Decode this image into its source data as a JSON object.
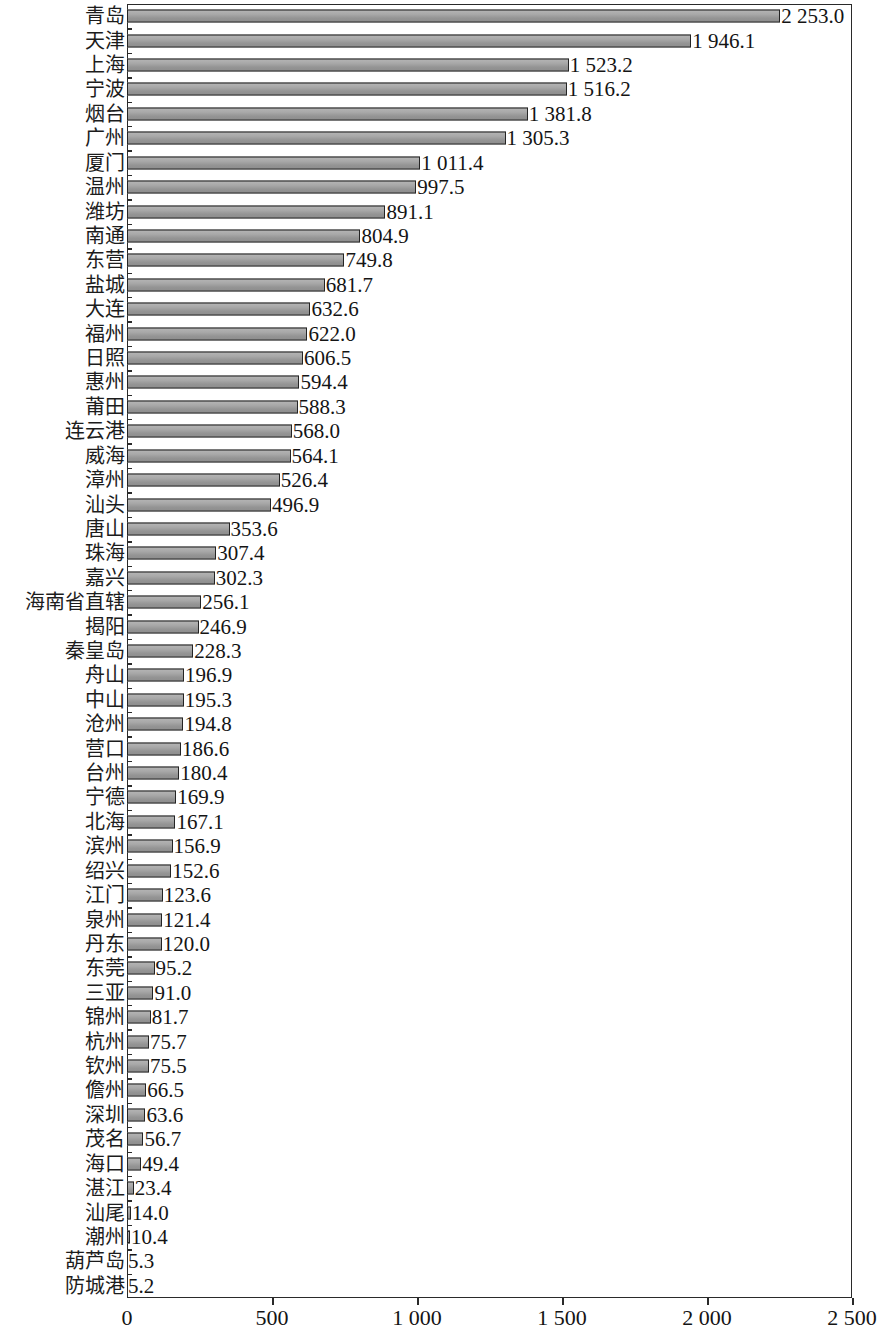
{
  "chart_data": {
    "type": "bar",
    "orientation": "horizontal",
    "title": "",
    "subtitle": "",
    "xlabel": "",
    "ylabel": "",
    "xlim": [
      0,
      2500
    ],
    "xticks": [
      0,
      500,
      1000,
      1500,
      2000,
      2500
    ],
    "xtick_labels": [
      "0",
      "500",
      "1 000",
      "1 500",
      "2 000",
      "2 500"
    ],
    "grid": false,
    "legend": null,
    "bar_color": "#9e9e9e",
    "bar_edge_color": "#242424",
    "axis_color": "#2a2a2a",
    "categories": [
      "青岛",
      "天津",
      "上海",
      "宁波",
      "烟台",
      "广州",
      "厦门",
      "温州",
      "潍坊",
      "南通",
      "东营",
      "盐城",
      "大连",
      "福州",
      "日照",
      "惠州",
      "莆田",
      "连云港",
      "威海",
      "漳州",
      "汕头",
      "唐山",
      "珠海",
      "嘉兴",
      "海南省直辖",
      "揭阳",
      "秦皇岛",
      "舟山",
      "中山",
      "沧州",
      "营口",
      "台州",
      "宁德",
      "北海",
      "滨州",
      "绍兴",
      "江门",
      "泉州",
      "丹东",
      "东莞",
      "三亚",
      "锦州",
      "杭州",
      "钦州",
      "儋州",
      "深圳",
      "茂名",
      "海口",
      "湛江",
      "汕尾",
      "潮州",
      "葫芦岛",
      "防城港"
    ],
    "values": [
      2253.0,
      1946.1,
      1523.2,
      1516.2,
      1381.8,
      1305.3,
      1011.4,
      997.5,
      891.1,
      804.9,
      749.8,
      681.7,
      632.6,
      622.0,
      606.5,
      594.4,
      588.3,
      568.0,
      564.1,
      526.4,
      496.9,
      353.6,
      307.4,
      302.3,
      256.1,
      246.9,
      228.3,
      196.9,
      195.3,
      194.8,
      186.6,
      180.4,
      169.9,
      167.1,
      156.9,
      152.6,
      123.6,
      121.4,
      120.0,
      95.2,
      91.0,
      81.7,
      75.7,
      75.5,
      66.5,
      63.6,
      56.7,
      49.4,
      23.4,
      14.0,
      10.4,
      5.3,
      5.2
    ],
    "value_labels": [
      "2 253.0",
      "1 946.1",
      "1 523.2",
      "1 516.2",
      "1 381.8",
      "1 305.3",
      "1 011.4",
      "997.5",
      "891.1",
      "804.9",
      "749.8",
      "681.7",
      "632.6",
      "622.0",
      "606.5",
      "594.4",
      "588.3",
      "568.0",
      "564.1",
      "526.4",
      "496.9",
      "353.6",
      "307.4",
      "302.3",
      "256.1",
      "246.9",
      "228.3",
      "196.9",
      "195.3",
      "194.8",
      "186.6",
      "180.4",
      "169.9",
      "167.1",
      "156.9",
      "152.6",
      "123.6",
      "121.4",
      "120.0",
      "95.2",
      "91.0",
      "81.7",
      "75.7",
      "75.5",
      "66.5",
      "63.6",
      "56.7",
      "49.4",
      "23.4",
      "14.0",
      "10.4",
      "5.3",
      "5.2"
    ]
  }
}
